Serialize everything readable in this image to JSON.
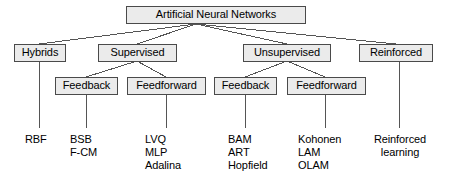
{
  "diagram": {
    "colors": {
      "box_fill": "#ebebeb",
      "box_border": "#4a4a4a",
      "line": "#555555",
      "text": "#000000",
      "background": "#ffffff"
    },
    "root": {
      "label": "Artificial Neural Networks"
    },
    "level1": [
      {
        "label": "Hybrids"
      },
      {
        "label": "Supervised"
      },
      {
        "label": "Unsupervised"
      },
      {
        "label": "Reinforced"
      }
    ],
    "level2": [
      {
        "label": "Feedback"
      },
      {
        "label": "Feedforward"
      },
      {
        "label": "Feedback"
      },
      {
        "label": "Feedforward"
      }
    ],
    "leaves": [
      {
        "lines": [
          "RBF"
        ]
      },
      {
        "lines": [
          "BSB",
          "F-CM"
        ]
      },
      {
        "lines": [
          "LVQ",
          "MLP",
          "Adalina"
        ]
      },
      {
        "lines": [
          "BAM",
          "ART",
          "Hopfield"
        ]
      },
      {
        "lines": [
          "Kohonen",
          "LAM",
          "OLAM"
        ]
      },
      {
        "lines": [
          "Reinforced",
          "learning"
        ]
      }
    ]
  }
}
